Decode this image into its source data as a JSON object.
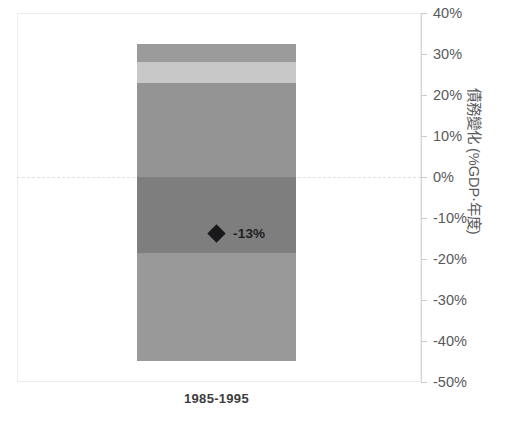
{
  "chart_data": {
    "type": "bar",
    "title": "",
    "subtitle": "",
    "xlabel": "",
    "ylabel": "債務變化 (%GDP‧年度)",
    "categories": [
      "1985-1995"
    ],
    "ylim": [
      -50,
      40
    ],
    "yticks": [
      40,
      30,
      20,
      10,
      0,
      -10,
      -20,
      -30,
      -40,
      -50
    ],
    "ytick_labels": [
      "40%",
      "30%",
      "20%",
      "10%",
      "0%",
      "-10%",
      "-20%",
      "-30%",
      "-40%",
      "-50%"
    ],
    "grid": false,
    "zero_line": true,
    "legend": "none",
    "stacked": true,
    "series": [
      {
        "name": "segment-1",
        "values": [
          4.5
        ],
        "start": 28.0,
        "end": 32.5,
        "color": "#9b9b9b"
      },
      {
        "name": "segment-2",
        "values": [
          5.0
        ],
        "start": 23.0,
        "end": 28.0,
        "color": "#c8c8c8"
      },
      {
        "name": "segment-3",
        "values": [
          23.0
        ],
        "start": 0.0,
        "end": 23.0,
        "color": "#949494"
      },
      {
        "name": "segment-4",
        "values": [
          -18.5
        ],
        "start": -18.5,
        "end": 0.0,
        "color": "#7e7e7e"
      },
      {
        "name": "segment-5",
        "values": [
          -26.5
        ],
        "start": -45.0,
        "end": -18.5,
        "color": "#999999"
      }
    ],
    "annotations": [
      {
        "marker": "diamond",
        "label": "-13%",
        "value": -13,
        "category": "1985-1995",
        "color": "#18181a"
      }
    ]
  },
  "axis": {
    "y_title": "債務變化 (%GDP‧年度)",
    "ticks": [
      {
        "label": "40%",
        "value": 40
      },
      {
        "label": "30%",
        "value": 30
      },
      {
        "label": "20%",
        "value": 20
      },
      {
        "label": "10%",
        "value": 10
      },
      {
        "label": "0%",
        "value": 0
      },
      {
        "label": "-10%",
        "value": -10
      },
      {
        "label": "-20%",
        "value": -20
      },
      {
        "label": "-30%",
        "value": -30
      },
      {
        "label": "-40%",
        "value": -40
      },
      {
        "label": "-50%",
        "value": -50
      }
    ]
  },
  "bar": {
    "category_label": "1985-1995",
    "segments": [
      {
        "name": "segment-1",
        "color": "#9b9b9b",
        "top_pct": 32.5,
        "bottom_pct": 28.0
      },
      {
        "name": "segment-2",
        "color": "#c8c8c8",
        "top_pct": 28.0,
        "bottom_pct": 23.0
      },
      {
        "name": "segment-3",
        "color": "#949494",
        "top_pct": 23.0,
        "bottom_pct": 0.0
      },
      {
        "name": "segment-4",
        "color": "#7e7e7e",
        "top_pct": 0.0,
        "bottom_pct": -18.5
      },
      {
        "name": "segment-5",
        "color": "#999999",
        "top_pct": -18.5,
        "bottom_pct": -45.0
      }
    ]
  },
  "marker": {
    "label": "-13%",
    "value": -13,
    "color": "#18181a"
  },
  "colors": {
    "frame": "#ececed",
    "axis_line": "#d6d7d8",
    "tick": "#c9cacb",
    "zero_line": "#dfe0e1",
    "tick_text": "#58595b",
    "category_text": "#3b3c3e"
  }
}
